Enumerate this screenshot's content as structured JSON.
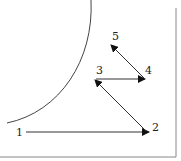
{
  "diagram": {
    "labels": [
      {
        "id": "1",
        "text": "1",
        "x": 16,
        "y": 136
      },
      {
        "id": "2",
        "text": "2",
        "x": 152,
        "y": 131
      },
      {
        "id": "3",
        "text": "3",
        "x": 96,
        "y": 74
      },
      {
        "id": "4",
        "text": "4",
        "x": 145,
        "y": 74
      },
      {
        "id": "5",
        "text": "5",
        "x": 112,
        "y": 40
      }
    ],
    "arrows": [
      {
        "from": "1",
        "to": "2"
      },
      {
        "from": "2",
        "to": "3"
      },
      {
        "from": "3",
        "to": "4"
      },
      {
        "from": "4",
        "to": "5"
      }
    ],
    "colors": {
      "stroke": "#333333",
      "border": "#888888"
    }
  }
}
